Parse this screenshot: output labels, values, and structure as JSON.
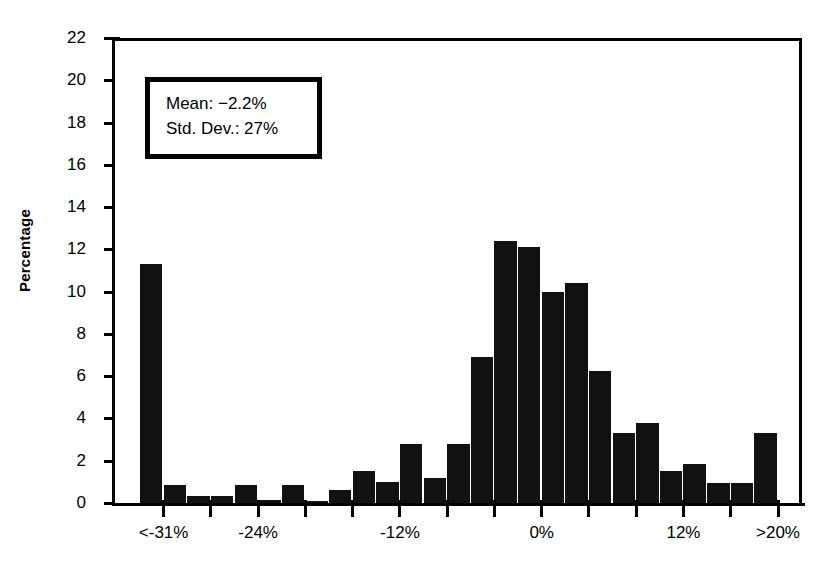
{
  "chart_data": {
    "type": "bar",
    "title": "",
    "subtitle": "",
    "xlabel": "",
    "ylabel": "Percentage",
    "ylim": [
      0,
      22
    ],
    "ytick_values": [
      0,
      2,
      4,
      6,
      8,
      10,
      12,
      14,
      16,
      18,
      20,
      22
    ],
    "ytick_labels": [
      "0",
      "2",
      "4",
      "6",
      "8",
      "10",
      "12",
      "14",
      "16",
      "18",
      "20",
      "22"
    ],
    "grid": false,
    "legend": null,
    "bar_color": "#111111",
    "categories": [
      "<-31%",
      "-30%",
      "-28%",
      "-26%",
      "-24%",
      "-22%",
      "-20%",
      "-18%",
      "-16%",
      "-14%",
      "-12%",
      "-10%",
      "-8%",
      "-6%",
      "-4%",
      "-2%",
      "0%",
      "2%",
      "4%",
      "6%",
      "8%",
      "10%",
      "12%",
      "14%",
      "16%",
      "18%",
      ">20%"
    ],
    "values": [
      11.3,
      0.85,
      0.35,
      0.35,
      0.85,
      0.15,
      0.85,
      0.1,
      0.6,
      1.5,
      1.0,
      2.8,
      1.2,
      2.8,
      6.9,
      12.4,
      12.1,
      10.0,
      10.4,
      6.25,
      3.3,
      3.8,
      1.5,
      1.85,
      0.95,
      0.95,
      3.3
    ],
    "xtick_labels": [
      "<-31%",
      "-24%",
      "-12%",
      "0%",
      "12%",
      ">20%"
    ],
    "xtick_label_positions": [
      1,
      5,
      11,
      17,
      23,
      27
    ],
    "annotations": [
      {
        "name": "mean",
        "text": "Mean: −2.2%"
      },
      {
        "name": "std-dev",
        "text": "Std. Dev.: 27%"
      }
    ]
  },
  "stats_box": {
    "mean_label": "Mean: −2.2%",
    "std_dev_label": "Std. Dev.: 27%"
  }
}
